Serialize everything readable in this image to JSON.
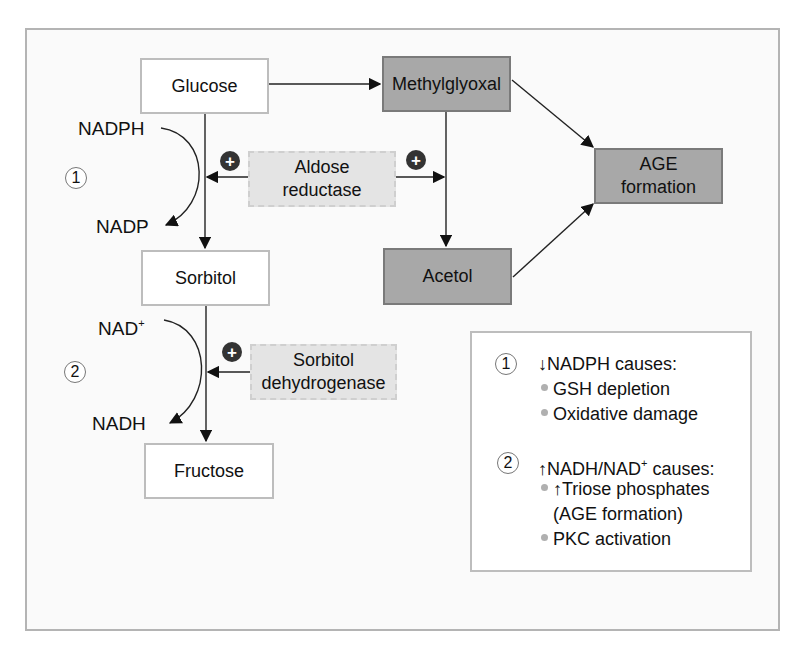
{
  "diagram": {
    "nodes": {
      "glucose": "Glucose",
      "sorbitol": "Sorbitol",
      "fructose": "Fructose",
      "methylglyoxal": "Methylglyoxal",
      "acetol": "Acetol",
      "age_line1": "AGE",
      "age_line2": "formation"
    },
    "enzymes": {
      "aldose_line1": "Aldose",
      "aldose_line2": "reductase",
      "sdh_line1": "Sorbitol",
      "sdh_line2": "dehydrogenase"
    },
    "cofactors": {
      "nadph": "NADPH",
      "nadp": "NADP",
      "nad": "NAD",
      "nad_sup": "+",
      "nadh": "NADH"
    },
    "step_markers": [
      "1",
      "2"
    ],
    "activator_symbol": "+",
    "legend": {
      "items": [
        {
          "number": "1",
          "arrow": "↓",
          "heading": "NADPH causes:",
          "bullets": [
            "GSH depletion",
            "Oxidative damage"
          ]
        },
        {
          "number": "2",
          "arrow": "↑",
          "heading_pre": "NADH/NAD",
          "heading_sup": "+",
          "heading_post": " causes:",
          "bullets": [
            "↑Triose phosphates",
            "(AGE formation)",
            "PKC activation"
          ]
        }
      ]
    },
    "colors": {
      "white_box": "#ffffff",
      "dark_box": "#a8a8a8",
      "enzyme_box": "#e4e4e4",
      "activator": "#333333",
      "border": "#bdbdbd"
    }
  }
}
